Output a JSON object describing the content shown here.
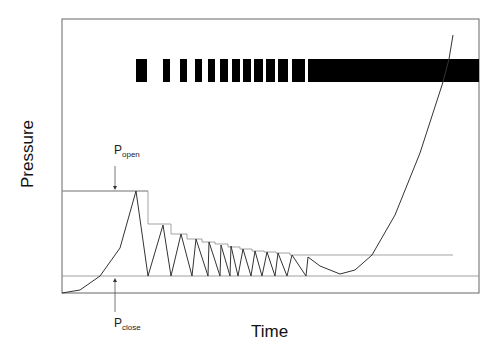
{
  "chart_data": {
    "type": "line",
    "title": "",
    "xlabel": "Time",
    "ylabel": "Pressure",
    "grid": false,
    "legend": null,
    "axis_ticks": "none",
    "annotations": [
      {
        "label": "P",
        "subscript": "open",
        "meaning": "opening pressure threshold",
        "arrow": "down"
      },
      {
        "label": "P",
        "subscript": "close",
        "meaning": "closing pressure threshold",
        "arrow": "up"
      }
    ],
    "thresholds": {
      "p_open_px_y": 191,
      "p_close_px_y": 276
    },
    "pressure_curve": {
      "description": "Pressure rises from baseline to P_open, then oscillates in a sawtooth between P_close and a decaying peak, then dips slightly and rises steeply",
      "points_px": [
        [
          62,
          293
        ],
        [
          80,
          290
        ],
        [
          100,
          276
        ],
        [
          120,
          248
        ],
        [
          136,
          191
        ],
        [
          148,
          276
        ],
        [
          163,
          225
        ],
        [
          171,
          276
        ],
        [
          181,
          234
        ],
        [
          192,
          276
        ],
        [
          196,
          239
        ],
        [
          208,
          276
        ],
        [
          209,
          242
        ],
        [
          220,
          276
        ],
        [
          221,
          245
        ],
        [
          230,
          276
        ],
        [
          231,
          246
        ],
        [
          238,
          276
        ],
        [
          243,
          249
        ],
        [
          251,
          276
        ],
        [
          255,
          251
        ],
        [
          262,
          276
        ],
        [
          267,
          252
        ],
        [
          275,
          276
        ],
        [
          278,
          253
        ],
        [
          287,
          276
        ],
        [
          292,
          255
        ],
        [
          306,
          276
        ],
        [
          308,
          257
        ],
        [
          320,
          266
        ],
        [
          340,
          274
        ],
        [
          355,
          270
        ],
        [
          372,
          255
        ],
        [
          395,
          215
        ],
        [
          420,
          153
        ],
        [
          443,
          82
        ],
        [
          449,
          59
        ],
        [
          453,
          35
        ]
      ]
    },
    "step_threshold_line": {
      "description": "Stepped upper envelope decreasing after each cycle",
      "points_px": [
        [
          62,
          191
        ],
        [
          148,
          191
        ],
        [
          148,
          224
        ],
        [
          171,
          224
        ],
        [
          171,
          234
        ],
        [
          187,
          234
        ],
        [
          187,
          239
        ],
        [
          202,
          239
        ],
        [
          202,
          242
        ],
        [
          215,
          242
        ],
        [
          215,
          244
        ],
        [
          228,
          244
        ],
        [
          228,
          247
        ],
        [
          240,
          247
        ],
        [
          240,
          249
        ],
        [
          252,
          249
        ],
        [
          252,
          251
        ],
        [
          264,
          251
        ],
        [
          264,
          252
        ],
        [
          276,
          252
        ],
        [
          276,
          253
        ],
        [
          290,
          253
        ],
        [
          290,
          255
        ],
        [
          453,
          255
        ]
      ]
    },
    "event_bars": {
      "description": "Black bars marking events/openings along time axis; final bar continuous",
      "y_top": 59,
      "y_bottom": 82,
      "segments_px": [
        [
          136,
          147
        ],
        [
          163,
          170
        ],
        [
          180,
          187
        ],
        [
          195,
          202
        ],
        [
          208,
          215
        ],
        [
          220,
          228
        ],
        [
          232,
          240
        ],
        [
          243,
          251
        ],
        [
          254,
          263
        ],
        [
          266,
          275
        ],
        [
          278,
          288
        ],
        [
          292,
          305
        ],
        [
          308,
          479
        ]
      ]
    },
    "plot_area_px": {
      "left": 62,
      "top": 19,
      "right": 479,
      "bottom": 293
    }
  },
  "labels": {
    "x": "Time",
    "y": "Pressure",
    "p_open_main": "P",
    "p_open_sub": "open",
    "p_close_main": "P",
    "p_close_sub": "close"
  }
}
